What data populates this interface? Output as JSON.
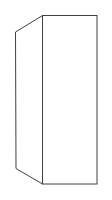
{
  "figure": {
    "stroke_color": "#404040",
    "background": "#ffffff",
    "front_face": {
      "x1": 42,
      "y1": 15,
      "x2": 97,
      "y2": 184
    },
    "side_face": [
      [
        15,
        32
      ],
      [
        42,
        15
      ],
      [
        42,
        184
      ],
      [
        16,
        168
      ]
    ]
  }
}
